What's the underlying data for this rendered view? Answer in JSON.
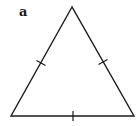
{
  "figure": {
    "panel_label": "a",
    "shape": "equilateral-triangle",
    "stroke_color": "#1a1a1a",
    "background": "#ffffff",
    "vertices": {
      "apex": [
        72,
        7
      ],
      "bottom_left": [
        11,
        116
      ],
      "bottom_right": [
        134,
        116
      ]
    },
    "tick_marks": [
      {
        "side": "left",
        "center": [
          41,
          63
        ]
      },
      {
        "side": "right",
        "center": [
          103,
          62
        ]
      },
      {
        "side": "base",
        "center": [
          73,
          116
        ]
      }
    ]
  }
}
